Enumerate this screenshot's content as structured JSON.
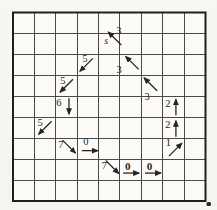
{
  "figure": {
    "type": "grid-vector-diagram",
    "background": "#f7f6f2",
    "paper_color": "#fcfbf8",
    "ink_color": "#262626",
    "grid": {
      "left": 13,
      "top": 12.5,
      "right": 205.5,
      "bottom": 201,
      "cols": 9,
      "rows": 9,
      "inner_line_color": "#4a4a4a",
      "border_color": "#1f1f1f"
    },
    "start_label": "s",
    "vectors": [
      {
        "row": 2,
        "col": 5,
        "dir": "nw",
        "label": "3",
        "bold": false,
        "prefix": "s",
        "arrow_shift": [
          5.5,
          -5.5
        ],
        "label_offset": [
          9.5,
          -13
        ],
        "prefix_offset": [
          -3,
          -3
        ]
      },
      {
        "row": 3,
        "col": 4,
        "dir": "sw",
        "label": "5",
        "bold": false,
        "arrow_shift": [
          -1.5,
          0
        ],
        "label_offset": [
          -3,
          -6
        ]
      },
      {
        "row": 3,
        "col": 6,
        "dir": "nw",
        "label": "3",
        "bold": false,
        "arrow_shift": [
          1.5,
          -2
        ],
        "label_offset": [
          -11.5,
          5
        ]
      },
      {
        "row": 4,
        "col": 3,
        "dir": "sw",
        "label": "5",
        "bold": false,
        "arrow_shift": [
          0,
          0
        ],
        "label_offset": [
          -3.5,
          -5
        ]
      },
      {
        "row": 4,
        "col": 7,
        "dir": "nw",
        "label": "3",
        "bold": false,
        "arrow_shift": [
          -1.5,
          -1.5
        ],
        "label_offset": [
          -5,
          10.5
        ]
      },
      {
        "row": 5,
        "col": 3,
        "dir": "down",
        "label": "6",
        "bold": false,
        "arrow_shift": [
          2.5,
          -0.5
        ],
        "label_offset": [
          -7.5,
          -4.5
        ]
      },
      {
        "row": 5,
        "col": 8,
        "dir": "up",
        "label": "2",
        "bold": false,
        "arrow_shift": [
          2.5,
          0.5
        ],
        "label_offset": [
          -5.5,
          -3.5
        ]
      },
      {
        "row": 6,
        "col": 2,
        "dir": "sw",
        "label": "5",
        "bold": false,
        "arrow_shift": [
          0,
          0
        ],
        "label_offset": [
          -5,
          -5.5
        ]
      },
      {
        "row": 6,
        "col": 8,
        "dir": "up",
        "label": "2",
        "bold": false,
        "arrow_shift": [
          2.5,
          1
        ],
        "label_offset": [
          -5.5,
          -3.5
        ]
      },
      {
        "row": 7,
        "col": 3,
        "dir": "se",
        "label": "7",
        "bold": false,
        "arrow_shift": [
          2.5,
          -2
        ],
        "label_offset": [
          -5.5,
          -4
        ]
      },
      {
        "row": 7,
        "col": 4,
        "dir": "right",
        "label": "0",
        "bold": false,
        "arrow_shift": [
          2,
          2
        ],
        "label_offset": [
          -2,
          -7.5
        ]
      },
      {
        "row": 7,
        "col": 8,
        "dir": "ne",
        "label": "1",
        "bold": false,
        "arrow_shift": [
          2,
          1
        ],
        "label_offset": [
          -5,
          -6
        ]
      },
      {
        "row": 8,
        "col": 5,
        "dir": "se",
        "label": "7",
        "bold": false,
        "arrow_shift": [
          3,
          -2.5
        ],
        "label_offset": [
          -5,
          -4
        ]
      },
      {
        "row": 8,
        "col": 6,
        "dir": "right",
        "label": "0",
        "bold": true,
        "arrow_shift": [
          0.5,
          3.5
        ],
        "label_offset": [
          -3,
          -4
        ]
      },
      {
        "row": 8,
        "col": 7,
        "dir": "right",
        "label": "0",
        "bold": true,
        "arrow_shift": [
          1,
          3.5
        ],
        "label_offset": [
          -2.5,
          -4
        ]
      }
    ],
    "ink_speck": {
      "x": 206.5,
      "y": 202,
      "w": 4.5,
      "h": 4
    }
  }
}
